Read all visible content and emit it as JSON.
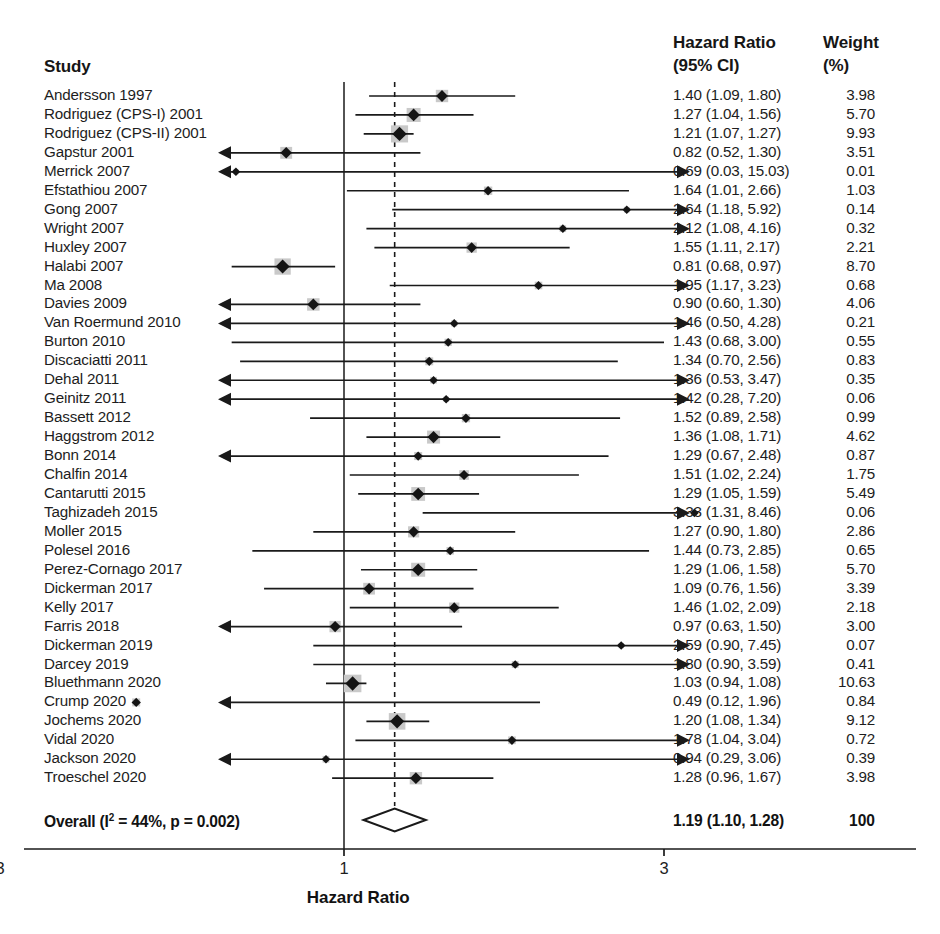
{
  "header": {
    "study_label": "Study",
    "hr_label_line1": "Hazard Ratio",
    "hr_label_line2": "(95% CI)",
    "weight_label_line1": "Weight",
    "weight_label_line2": "(%)"
  },
  "axis": {
    "title": "Hazard Ratio",
    "ticks": [
      0.3,
      1,
      3
    ],
    "tick_labels": [
      "0.3",
      "1",
      "3"
    ],
    "scale": "log",
    "xmin": 0.22,
    "xmax": 3.45,
    "null_line": 1,
    "pooled_line": 1.19
  },
  "overall": {
    "label_prefix": "Overall (I",
    "label_sup": "2",
    "label_suffix": " = 44%, p = 0.002)",
    "label_full": "Overall (I2 = 44%, p = 0.002)",
    "hr_text": "1.19 (1.10, 1.28)",
    "weight_text": "100",
    "estimate": 1.19,
    "lower": 1.1,
    "upper": 1.28,
    "i_squared": "44%",
    "p_value": "0.002"
  },
  "colors": {
    "line": "#1a1a1a",
    "marker": "#141414",
    "box": "#c9c9c9",
    "text": "#1d1d1d",
    "background": "#ffffff"
  },
  "chart_data": {
    "type": "forest",
    "title": "Hazard Ratio",
    "xlabel": "Hazard Ratio",
    "ylabel": "Study",
    "xscale": "log",
    "xlim": [
      0.22,
      3.45
    ],
    "grid": false,
    "columns": [
      "Study",
      "Hazard Ratio (95% CI)",
      "Weight (%)"
    ],
    "rows": [
      {
        "study": "Andersson 1997",
        "hr": 1.4,
        "lo": 1.09,
        "hi": 1.8,
        "hr_text": "1.40 (1.09, 1.80)",
        "weight": 3.98,
        "weight_text": "3.98",
        "clip_lo": false,
        "clip_hi": false
      },
      {
        "study": "Rodriguez (CPS-I) 2001",
        "hr": 1.27,
        "lo": 1.04,
        "hi": 1.56,
        "hr_text": "1.27 (1.04, 1.56)",
        "weight": 5.7,
        "weight_text": "5.70",
        "clip_lo": false,
        "clip_hi": false
      },
      {
        "study": "Rodriguez (CPS-II) 2001",
        "hr": 1.21,
        "lo": 1.07,
        "hi": 1.27,
        "hr_text": "1.21 (1.07, 1.27)",
        "weight": 9.93,
        "weight_text": "9.93",
        "clip_lo": false,
        "clip_hi": false
      },
      {
        "study": "Gapstur 2001",
        "hr": 0.82,
        "lo": 0.52,
        "hi": 1.3,
        "hr_text": "0.82 (0.52, 1.30)",
        "weight": 3.51,
        "weight_text": "3.51",
        "clip_lo": false,
        "clip_hi": false
      },
      {
        "study": "Merrick 2007",
        "hr": 0.69,
        "lo": 0.03,
        "hi": 15.03,
        "hr_text": "0.69 (0.03, 15.03)",
        "weight": 0.01,
        "weight_text": "0.01",
        "clip_lo": true,
        "clip_hi": true
      },
      {
        "study": "Efstathiou 2007",
        "hr": 1.64,
        "lo": 1.01,
        "hi": 2.66,
        "hr_text": "1.64 (1.01, 2.66)",
        "weight": 1.03,
        "weight_text": "1.03",
        "clip_lo": false,
        "clip_hi": false
      },
      {
        "study": "Gong 2007",
        "hr": 2.64,
        "lo": 1.18,
        "hi": 5.92,
        "hr_text": "2.64 (1.18, 5.92)",
        "weight": 0.14,
        "weight_text": "0.14",
        "clip_lo": false,
        "clip_hi": true
      },
      {
        "study": "Wright 2007",
        "hr": 2.12,
        "lo": 1.08,
        "hi": 4.16,
        "hr_text": "2.12 (1.08, 4.16)",
        "weight": 0.32,
        "weight_text": "0.32",
        "clip_lo": false,
        "clip_hi": true
      },
      {
        "study": "Huxley 2007",
        "hr": 1.55,
        "lo": 1.11,
        "hi": 2.17,
        "hr_text": "1.55 (1.11, 2.17)",
        "weight": 2.21,
        "weight_text": "2.21",
        "clip_lo": false,
        "clip_hi": false
      },
      {
        "study": "Halabi 2007",
        "hr": 0.81,
        "lo": 0.68,
        "hi": 0.97,
        "hr_text": "0.81 (0.68, 0.97)",
        "weight": 8.7,
        "weight_text": "8.70",
        "clip_lo": false,
        "clip_hi": false
      },
      {
        "study": "Ma 2008",
        "hr": 1.95,
        "lo": 1.17,
        "hi": 3.23,
        "hr_text": "1.95 (1.17, 3.23)",
        "weight": 0.68,
        "weight_text": "0.68",
        "clip_lo": false,
        "clip_hi": false
      },
      {
        "study": "Davies 2009",
        "hr": 0.9,
        "lo": 0.6,
        "hi": 1.3,
        "hr_text": "0.90 (0.60, 1.30)",
        "weight": 4.06,
        "weight_text": "4.06",
        "clip_lo": false,
        "clip_hi": false
      },
      {
        "study": "Van Roermund 2010",
        "hr": 1.46,
        "lo": 0.5,
        "hi": 4.28,
        "hr_text": "1.46 (0.50, 4.28)",
        "weight": 0.21,
        "weight_text": "0.21",
        "clip_lo": false,
        "clip_hi": true
      },
      {
        "study": "Burton 2010",
        "hr": 1.43,
        "lo": 0.68,
        "hi": 3.0,
        "hr_text": "1.43 (0.68, 3.00)",
        "weight": 0.55,
        "weight_text": "0.55",
        "clip_lo": false,
        "clip_hi": false
      },
      {
        "study": "Discaciatti 2011",
        "hr": 1.34,
        "lo": 0.7,
        "hi": 2.56,
        "hr_text": "1.34 (0.70, 2.56)",
        "weight": 0.83,
        "weight_text": "0.83",
        "clip_lo": false,
        "clip_hi": false
      },
      {
        "study": "Dehal 2011",
        "hr": 1.36,
        "lo": 0.53,
        "hi": 3.47,
        "hr_text": "1.36 (0.53, 3.47)",
        "weight": 0.35,
        "weight_text": "0.35",
        "clip_lo": false,
        "clip_hi": true
      },
      {
        "study": "Geinitz 2011",
        "hr": 1.42,
        "lo": 0.28,
        "hi": 7.2,
        "hr_text": "1.42 (0.28, 7.20)",
        "weight": 0.06,
        "weight_text": "0.06",
        "clip_lo": true,
        "clip_hi": true
      },
      {
        "study": "Bassett 2012",
        "hr": 1.52,
        "lo": 0.89,
        "hi": 2.58,
        "hr_text": "1.52 (0.89, 2.58)",
        "weight": 0.99,
        "weight_text": "0.99",
        "clip_lo": false,
        "clip_hi": false
      },
      {
        "study": "Haggstrom 2012",
        "hr": 1.36,
        "lo": 1.08,
        "hi": 1.71,
        "hr_text": "1.36 (1.08, 1.71)",
        "weight": 4.62,
        "weight_text": "4.62",
        "clip_lo": false,
        "clip_hi": false
      },
      {
        "study": "Bonn 2014",
        "hr": 1.29,
        "lo": 0.67,
        "hi": 2.48,
        "hr_text": "1.29 (0.67, 2.48)",
        "weight": 0.87,
        "weight_text": "0.87",
        "clip_lo": false,
        "clip_hi": false
      },
      {
        "study": "Chalfin 2014",
        "hr": 1.51,
        "lo": 1.02,
        "hi": 2.24,
        "hr_text": "1.51 (1.02, 2.24)",
        "weight": 1.75,
        "weight_text": "1.75",
        "clip_lo": false,
        "clip_hi": false
      },
      {
        "study": "Cantarutti 2015",
        "hr": 1.29,
        "lo": 1.05,
        "hi": 1.59,
        "hr_text": "1.29 (1.05, 1.59)",
        "weight": 5.49,
        "weight_text": "5.49",
        "clip_lo": false,
        "clip_hi": false
      },
      {
        "study": "Taghizadeh 2015",
        "hr": 3.33,
        "lo": 1.31,
        "hi": 8.46,
        "hr_text": "3.33 (1.31, 8.46)",
        "weight": 0.06,
        "weight_text": "0.06",
        "clip_lo": false,
        "clip_hi": true
      },
      {
        "study": "Moller 2015",
        "hr": 1.27,
        "lo": 0.9,
        "hi": 1.8,
        "hr_text": "1.27 (0.90, 1.80)",
        "weight": 2.86,
        "weight_text": "2.86",
        "clip_lo": false,
        "clip_hi": false
      },
      {
        "study": "Polesel 2016",
        "hr": 1.44,
        "lo": 0.73,
        "hi": 2.85,
        "hr_text": "1.44 (0.73, 2.85)",
        "weight": 0.65,
        "weight_text": "0.65",
        "clip_lo": false,
        "clip_hi": false
      },
      {
        "study": "Perez-Cornago 2017",
        "hr": 1.29,
        "lo": 1.06,
        "hi": 1.58,
        "hr_text": "1.29 (1.06, 1.58)",
        "weight": 5.7,
        "weight_text": "5.70",
        "clip_lo": false,
        "clip_hi": false
      },
      {
        "study": "Dickerman 2017",
        "hr": 1.09,
        "lo": 0.76,
        "hi": 1.56,
        "hr_text": "1.09 (0.76, 1.56)",
        "weight": 3.39,
        "weight_text": "3.39",
        "clip_lo": false,
        "clip_hi": false
      },
      {
        "study": "Kelly 2017",
        "hr": 1.46,
        "lo": 1.02,
        "hi": 2.09,
        "hr_text": "1.46 (1.02, 2.09)",
        "weight": 2.18,
        "weight_text": "2.18",
        "clip_lo": false,
        "clip_hi": false
      },
      {
        "study": "Farris 2018",
        "hr": 0.97,
        "lo": 0.63,
        "hi": 1.5,
        "hr_text": "0.97 (0.63, 1.50)",
        "weight": 3.0,
        "weight_text": "3.00",
        "clip_lo": false,
        "clip_hi": false
      },
      {
        "study": "Dickerman 2019",
        "hr": 2.59,
        "lo": 0.9,
        "hi": 7.45,
        "hr_text": "2.59 (0.90, 7.45)",
        "weight": 0.07,
        "weight_text": "0.07",
        "clip_lo": false,
        "clip_hi": true
      },
      {
        "study": "Darcey 2019",
        "hr": 1.8,
        "lo": 0.9,
        "hi": 3.59,
        "hr_text": "1.80 (0.90, 3.59)",
        "weight": 0.41,
        "weight_text": "0.41",
        "clip_lo": false,
        "clip_hi": true
      },
      {
        "study": "Bluethmann 2020",
        "hr": 1.03,
        "lo": 0.94,
        "hi": 1.08,
        "hr_text": "1.03 (0.94, 1.08)",
        "weight": 10.63,
        "weight_text": "10.63",
        "clip_lo": false,
        "clip_hi": false
      },
      {
        "study": "Crump 2020",
        "hr": 0.49,
        "lo": 0.12,
        "hi": 1.96,
        "hr_text": "0.49 (0.12, 1.96)",
        "weight": 0.84,
        "weight_text": "0.84",
        "clip_lo": true,
        "clip_hi": false
      },
      {
        "study": "Jochems 2020",
        "hr": 1.2,
        "lo": 1.08,
        "hi": 1.34,
        "hr_text": "1.20 (1.08, 1.34)",
        "weight": 9.12,
        "weight_text": "9.12",
        "clip_lo": false,
        "clip_hi": false
      },
      {
        "study": "Vidal 2020",
        "hr": 1.78,
        "lo": 1.04,
        "hi": 3.04,
        "hr_text": "1.78 (1.04, 3.04)",
        "weight": 0.72,
        "weight_text": "0.72",
        "clip_lo": false,
        "clip_hi": true
      },
      {
        "study": "Jackson 2020",
        "hr": 0.94,
        "lo": 0.29,
        "hi": 3.06,
        "hr_text": "0.94 (0.29, 3.06)",
        "weight": 0.39,
        "weight_text": "0.39",
        "clip_lo": true,
        "clip_hi": true
      },
      {
        "study": "Troeschel 2020",
        "hr": 1.28,
        "lo": 0.96,
        "hi": 1.67,
        "hr_text": "1.28 (0.96, 1.67)",
        "weight": 3.98,
        "weight_text": "3.98",
        "clip_lo": false,
        "clip_hi": false
      }
    ],
    "pooled": {
      "label": "Overall (I2 = 44%, p = 0.002)",
      "hr": 1.19,
      "lo": 1.1,
      "hi": 1.28,
      "hr_text": "1.19 (1.10, 1.28)",
      "weight_text": "100"
    }
  }
}
